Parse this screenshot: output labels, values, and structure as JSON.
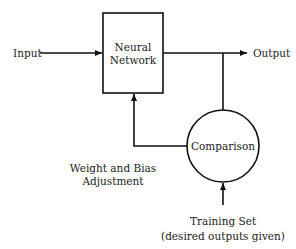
{
  "diagram": {
    "type": "block-diagram",
    "title": "",
    "colors": {
      "stroke": "#111111",
      "text": "#222222",
      "background": "#ffffff"
    },
    "nodes": {
      "input": {
        "label": "Input"
      },
      "neural_network": {
        "label_line1": "Neural",
        "label_line2": "Network",
        "shape": "rectangle"
      },
      "output": {
        "label": "Output"
      },
      "comparison": {
        "label": "Comparison",
        "shape": "circle"
      },
      "weight_adjustment": {
        "label_line1": "Weight and Bias",
        "label_line2": "Adjustment"
      },
      "training_set": {
        "label_line1": "Training Set",
        "label_line2": "(desired outputs given)"
      }
    },
    "edges": [
      {
        "from": "Input",
        "to": "Neural Network"
      },
      {
        "from": "Neural Network",
        "to": "Output"
      },
      {
        "from": "Neural Network output",
        "to": "Comparison"
      },
      {
        "from": "Comparison",
        "to": "Neural Network",
        "label": "Weight and Bias Adjustment"
      },
      {
        "from": "Training Set",
        "to": "Comparison"
      }
    ]
  }
}
